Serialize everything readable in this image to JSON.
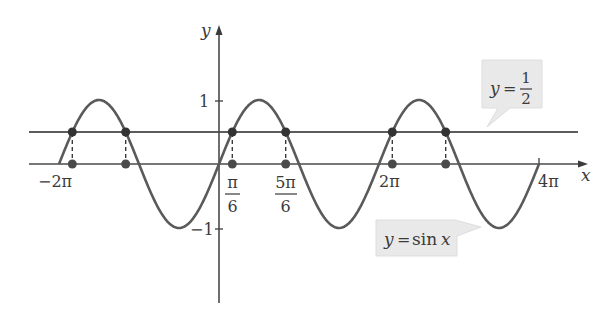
{
  "chart_data": {
    "type": "line",
    "title": "",
    "xlabel": "x",
    "ylabel": "y",
    "xlim": [
      -6.6,
      13.0
    ],
    "ylim": [
      -2.1,
      2.1
    ],
    "grid": false,
    "legend": "none",
    "series": [
      {
        "name": "y = sin x",
        "function": "sin(x)",
        "domain": [
          -6.2832,
          12.5664
        ]
      },
      {
        "name": "y = 1/2",
        "function": "0.5",
        "domain": [
          -7.5,
          14.0
        ]
      }
    ],
    "intersection_points": [
      {
        "x_label": "-2π + π/6",
        "x": -6.1087,
        "y": 0.5
      },
      {
        "x_label": "-2π + 5π/6",
        "x": -3.6652,
        "y": 0.5
      },
      {
        "x_label": "π/6",
        "x": 0.5236,
        "y": 0.5
      },
      {
        "x_label": "5π/6",
        "x": 2.618,
        "y": 0.5
      },
      {
        "x_label": "2π + π/6",
        "x": 6.8068,
        "y": 0.5
      },
      {
        "x_label": "2π + 5π/6",
        "x": 8.9012,
        "y": 0.5
      }
    ],
    "x_tick_labels": [
      "−2π",
      "π/6",
      "5π/6",
      "2π",
      "4π"
    ],
    "y_tick_labels": [
      "1",
      "−1"
    ],
    "annotations": [
      "y = 1/2",
      "y = sin x"
    ]
  },
  "axes": {
    "x_label": "x",
    "y_label": "y",
    "y_ticks": {
      "one": "1",
      "neg_one": "−1"
    },
    "x_ticks": {
      "neg_two_pi": "−2π",
      "pi_num": "π",
      "pi_den": "6",
      "five_pi_num": "5π",
      "five_pi_den": "6",
      "two_pi": "2π",
      "four_pi": "4π"
    }
  },
  "callouts": {
    "half": {
      "lhs": "y",
      "eq": "=",
      "num": "1",
      "den": "2"
    },
    "sin": {
      "lhs": "y",
      "eq": "=",
      "fn": "sin",
      "var": "x"
    }
  },
  "colors": {
    "curve": "#5a5a5a",
    "axis": "#4a4a4a",
    "point": "#3a3a3a",
    "callout_bg": "#e9e9e9"
  }
}
